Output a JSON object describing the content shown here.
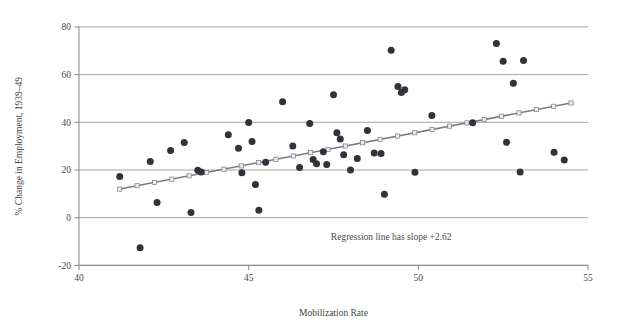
{
  "chart_data": {
    "type": "scatter",
    "title": "",
    "xlabel": "Mobilization Rate",
    "ylabel": "% Change in Employment, 1939–49",
    "xlim": [
      40,
      55
    ],
    "ylim": [
      -20,
      80
    ],
    "xticks": [
      40,
      45,
      50,
      55
    ],
    "xticklabels": [
      "40",
      "45",
      "50",
      "55"
    ],
    "yticks": [
      -20,
      0,
      20,
      40,
      60,
      80
    ],
    "yticklabels": [
      "-20",
      "0",
      "20",
      "40",
      "60",
      "80"
    ],
    "grid": "horizontal",
    "legend": "none",
    "annotations": [
      {
        "text": "Regression line has slope +2.62",
        "x": 49.2,
        "y": -9.5
      }
    ],
    "series": [
      {
        "name": "States",
        "type": "scatter",
        "marker": "filled-circle",
        "color": "#33313a",
        "points": [
          [
            41.2,
            17.3
          ],
          [
            41.8,
            -12.6
          ],
          [
            42.1,
            23.6
          ],
          [
            42.3,
            6.4
          ],
          [
            42.7,
            28.2
          ],
          [
            43.1,
            31.5
          ],
          [
            43.3,
            2.2
          ],
          [
            43.5,
            19.9
          ],
          [
            43.6,
            19.2
          ],
          [
            44.4,
            34.8
          ],
          [
            44.7,
            29.1
          ],
          [
            44.8,
            18.8
          ],
          [
            45.0,
            39.9
          ],
          [
            45.1,
            31.9
          ],
          [
            45.2,
            13.9
          ],
          [
            45.3,
            3.1
          ],
          [
            45.5,
            23.3
          ],
          [
            46.0,
            48.6
          ],
          [
            46.3,
            30.1
          ],
          [
            46.5,
            21.0
          ],
          [
            46.8,
            39.5
          ],
          [
            46.9,
            24.4
          ],
          [
            47.0,
            22.6
          ],
          [
            47.2,
            27.6
          ],
          [
            47.3,
            22.3
          ],
          [
            47.5,
            51.5
          ],
          [
            47.6,
            35.6
          ],
          [
            47.7,
            33.0
          ],
          [
            47.8,
            26.4
          ],
          [
            48.0,
            20.0
          ],
          [
            48.2,
            24.8
          ],
          [
            48.5,
            36.6
          ],
          [
            48.7,
            27.1
          ],
          [
            48.9,
            26.9
          ],
          [
            49.0,
            9.8
          ],
          [
            49.2,
            70.2
          ],
          [
            49.4,
            55.0
          ],
          [
            49.5,
            52.5
          ],
          [
            49.6,
            53.6
          ],
          [
            49.9,
            19.1
          ],
          [
            50.4,
            42.9
          ],
          [
            51.6,
            39.8
          ],
          [
            52.3,
            73.0
          ],
          [
            52.5,
            65.6
          ],
          [
            52.6,
            31.6
          ],
          [
            52.8,
            56.4
          ],
          [
            53.0,
            19.2
          ],
          [
            53.1,
            65.9
          ],
          [
            54.0,
            27.4
          ],
          [
            54.3,
            24.2
          ]
        ]
      }
    ],
    "regression_line": {
      "name": "Regression line",
      "slope": 2.62,
      "slope_label": "+2.62",
      "color": "#7a7a82",
      "marker": "open-square",
      "x_start": 41.2,
      "y_start": 12.0,
      "x_end": 54.5,
      "y_end": 48.1
    }
  }
}
